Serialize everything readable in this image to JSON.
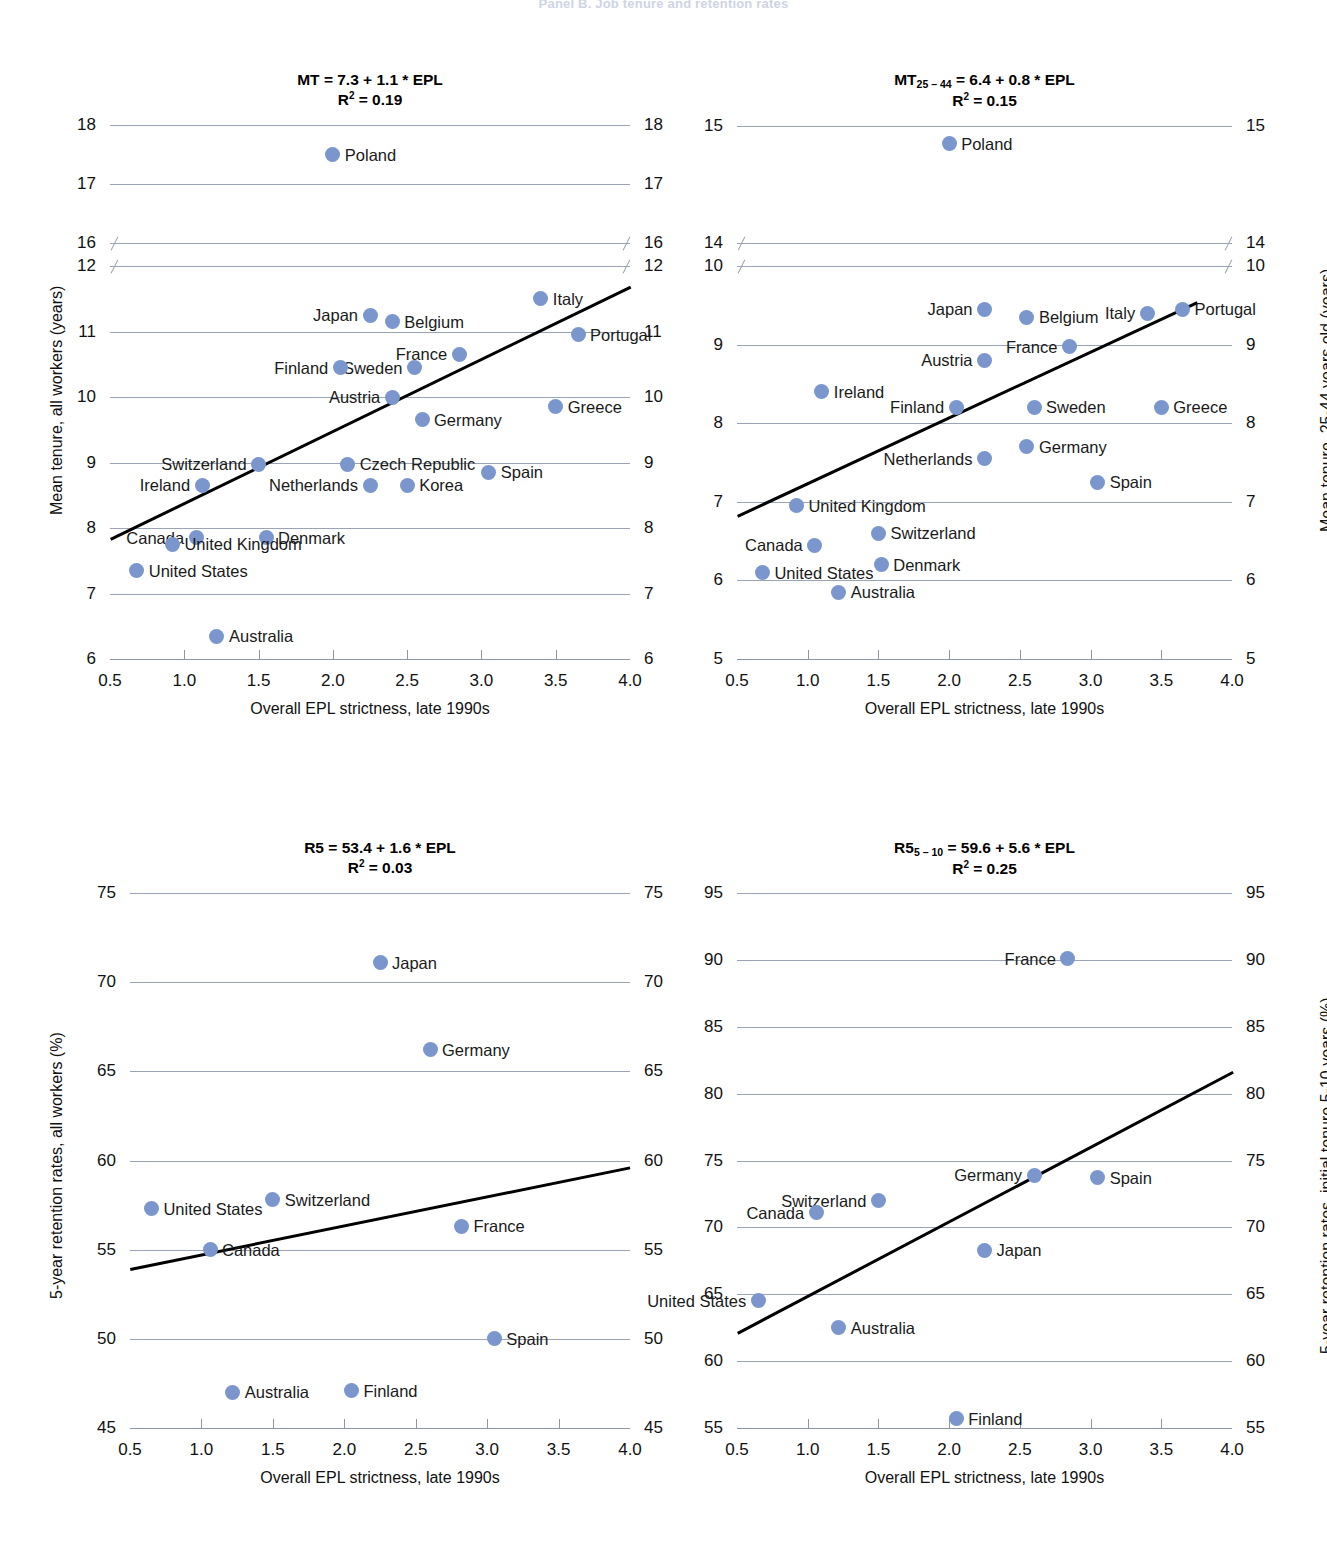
{
  "figure": {
    "header": "Panel B. Job tenure and retention rates",
    "xaxis_title": "Overall EPL strictness, late 1990s"
  },
  "chart_data": [
    {
      "type": "scatter",
      "panel": "top-left",
      "title_main": "MT = 7.3 + 1.1 * EPL",
      "title_r2_label": "R",
      "title_r2_sup": "2",
      "title_r2_value": " = 0.19",
      "xlabel": "Overall EPL strictness, late 1990s",
      "ylabel": "Mean tenure, all workers (years)",
      "xlim": [
        0.5,
        4.0
      ],
      "xticks": [
        0.5,
        1.0,
        1.5,
        2.0,
        2.5,
        3.0,
        3.5,
        4.0
      ],
      "yticks_upper": [
        18,
        17,
        16
      ],
      "yticks_lower": [
        12,
        11,
        10,
        9,
        8,
        7,
        6
      ],
      "axis_break_between": [
        16,
        12
      ],
      "grid": true,
      "trendline": {
        "x0": 0.5,
        "y0": 7.85,
        "x1": 4.0,
        "y1": 11.7
      },
      "points": [
        {
          "label": "Poland",
          "x": 2.0,
          "y": 17.5,
          "side": "r"
        },
        {
          "label": "Italy",
          "x": 3.4,
          "y": 11.5,
          "side": "r"
        },
        {
          "label": "Japan",
          "x": 2.25,
          "y": 11.25,
          "side": "l"
        },
        {
          "label": "Belgium",
          "x": 2.4,
          "y": 11.15,
          "side": "r"
        },
        {
          "label": "Portugal",
          "x": 3.65,
          "y": 10.95,
          "side": "r"
        },
        {
          "label": "France",
          "x": 2.85,
          "y": 10.65,
          "side": "l"
        },
        {
          "label": "Sweden",
          "x": 2.55,
          "y": 10.45,
          "side": "l"
        },
        {
          "label": "Finland",
          "x": 2.05,
          "y": 10.45,
          "side": "l"
        },
        {
          "label": "Austria",
          "x": 2.4,
          "y": 10.0,
          "side": "l"
        },
        {
          "label": "Greece",
          "x": 3.5,
          "y": 9.85,
          "side": "r"
        },
        {
          "label": "Germany",
          "x": 2.6,
          "y": 9.65,
          "side": "r"
        },
        {
          "label": "Switzerland",
          "x": 1.5,
          "y": 8.97,
          "side": "l"
        },
        {
          "label": "Czech Republic",
          "x": 2.1,
          "y": 8.97,
          "side": "r"
        },
        {
          "label": "Spain",
          "x": 3.05,
          "y": 8.85,
          "side": "r"
        },
        {
          "label": "Ireland",
          "x": 1.12,
          "y": 8.65,
          "side": "l"
        },
        {
          "label": "Netherlands",
          "x": 2.25,
          "y": 8.65,
          "side": "l"
        },
        {
          "label": "Korea",
          "x": 2.5,
          "y": 8.65,
          "side": "r"
        },
        {
          "label": "Canada",
          "x": 1.08,
          "y": 7.85,
          "side": "l"
        },
        {
          "label": "Denmark",
          "x": 1.55,
          "y": 7.85,
          "side": "r"
        },
        {
          "label": "United Kingdom",
          "x": 0.92,
          "y": 7.75,
          "side": "r"
        },
        {
          "label": "United States",
          "x": 0.68,
          "y": 7.35,
          "side": "r"
        },
        {
          "label": "Australia",
          "x": 1.22,
          "y": 6.35,
          "side": "r"
        }
      ]
    },
    {
      "type": "scatter",
      "panel": "top-right",
      "title_main_pre": "MT",
      "title_main_sub": "25 – 44",
      "title_main_post": " = 6.4 + 0.8 * EPL",
      "title_r2_label": "R",
      "title_r2_sup": "2",
      "title_r2_value": " = 0.15",
      "xlabel": "Overall EPL strictness, late 1990s",
      "ylabel": "Mean tenure, 25-44 years old (years)",
      "xlim": [
        0.5,
        4.0
      ],
      "xticks": [
        0.5,
        1.0,
        1.5,
        2.0,
        2.5,
        3.0,
        3.5,
        4.0
      ],
      "yticks_upper": [
        15,
        14
      ],
      "yticks_lower": [
        10,
        9,
        8,
        7,
        6,
        5
      ],
      "axis_break_between": [
        14,
        10
      ],
      "grid": true,
      "trendline": {
        "x0": 0.5,
        "y0": 6.83,
        "x1": 3.75,
        "y1": 9.55
      },
      "points": [
        {
          "label": "Poland",
          "x": 2.0,
          "y": 14.85,
          "side": "r"
        },
        {
          "label": "Italy",
          "x": 3.4,
          "y": 9.4,
          "side": "l"
        },
        {
          "label": "Portugal",
          "x": 3.65,
          "y": 9.45,
          "side": "r"
        },
        {
          "label": "Japan",
          "x": 2.25,
          "y": 9.45,
          "side": "l"
        },
        {
          "label": "Belgium",
          "x": 2.55,
          "y": 9.35,
          "side": "r"
        },
        {
          "label": "France",
          "x": 2.85,
          "y": 8.97,
          "side": "l"
        },
        {
          "label": "Austria",
          "x": 2.25,
          "y": 8.8,
          "side": "l"
        },
        {
          "label": "Ireland",
          "x": 1.1,
          "y": 8.4,
          "side": "r"
        },
        {
          "label": "Finland",
          "x": 2.05,
          "y": 8.2,
          "side": "l"
        },
        {
          "label": "Sweden",
          "x": 2.6,
          "y": 8.2,
          "side": "r"
        },
        {
          "label": "Greece",
          "x": 3.5,
          "y": 8.2,
          "side": "r"
        },
        {
          "label": "Germany",
          "x": 2.55,
          "y": 7.7,
          "side": "r"
        },
        {
          "label": "Netherlands",
          "x": 2.25,
          "y": 7.55,
          "side": "l"
        },
        {
          "label": "Spain",
          "x": 3.05,
          "y": 7.25,
          "side": "r"
        },
        {
          "label": "United Kingdom",
          "x": 0.92,
          "y": 6.95,
          "side": "r"
        },
        {
          "label": "Switzerland",
          "x": 1.5,
          "y": 6.6,
          "side": "r"
        },
        {
          "label": "Canada",
          "x": 1.05,
          "y": 6.45,
          "side": "l"
        },
        {
          "label": "Denmark",
          "x": 1.52,
          "y": 6.2,
          "side": "r"
        },
        {
          "label": "United States",
          "x": 0.68,
          "y": 6.1,
          "side": "r"
        },
        {
          "label": "Australia",
          "x": 1.22,
          "y": 5.85,
          "side": "r"
        }
      ]
    },
    {
      "type": "scatter",
      "panel": "bottom-left",
      "title_main": "R5 = 53.4 + 1.6 * EPL",
      "title_r2_label": "R",
      "title_r2_sup": "2",
      "title_r2_value": " = 0.03",
      "xlabel": "Overall EPL strictness, late 1990s",
      "ylabel": "5-year retention rates, all workers (%)",
      "xlim": [
        0.5,
        4.0
      ],
      "xticks": [
        0.5,
        1.0,
        1.5,
        2.0,
        2.5,
        3.0,
        3.5,
        4.0
      ],
      "yticks": [
        75,
        70,
        65,
        60,
        55,
        50,
        45
      ],
      "grid": true,
      "trendline": {
        "x0": 0.5,
        "y0": 54.0,
        "x1": 4.0,
        "y1": 59.7
      },
      "points": [
        {
          "label": "Japan",
          "x": 2.25,
          "y": 71.1,
          "side": "r"
        },
        {
          "label": "Germany",
          "x": 2.6,
          "y": 66.2,
          "side": "r"
        },
        {
          "label": "United States",
          "x": 0.65,
          "y": 57.3,
          "side": "r"
        },
        {
          "label": "Switzerland",
          "x": 1.5,
          "y": 57.8,
          "side": "r"
        },
        {
          "label": "France",
          "x": 2.82,
          "y": 56.3,
          "side": "r"
        },
        {
          "label": "Canada",
          "x": 1.06,
          "y": 55.0,
          "side": "r"
        },
        {
          "label": "Spain",
          "x": 3.05,
          "y": 50.0,
          "side": "r"
        },
        {
          "label": "Australia",
          "x": 1.22,
          "y": 47.0,
          "side": "r"
        },
        {
          "label": "Finland",
          "x": 2.05,
          "y": 47.1,
          "side": "r"
        }
      ]
    },
    {
      "type": "scatter",
      "panel": "bottom-right",
      "title_main_pre": "R5",
      "title_main_sub": "5 – 10",
      "title_main_post": " = 59.6 + 5.6 * EPL",
      "title_r2_label": "R",
      "title_r2_sup": "2",
      "title_r2_value": " = 0.25",
      "xlabel": "Overall EPL strictness, late 1990s",
      "ylabel": "5-year retention rates, initial tenure 5-10 years (%)",
      "xlim": [
        0.5,
        4.0
      ],
      "xticks": [
        0.5,
        1.0,
        1.5,
        2.0,
        2.5,
        3.0,
        3.5,
        4.0
      ],
      "yticks": [
        95,
        90,
        85,
        80,
        75,
        70,
        65,
        60,
        55
      ],
      "grid": true,
      "trendline": {
        "x0": 0.5,
        "y0": 62.2,
        "x1": 4.0,
        "y1": 81.7
      },
      "points": [
        {
          "label": "France",
          "x": 2.84,
          "y": 90.1,
          "side": "l"
        },
        {
          "label": "Germany",
          "x": 2.6,
          "y": 73.9,
          "side": "l"
        },
        {
          "label": "Spain",
          "x": 3.05,
          "y": 73.7,
          "side": "r"
        },
        {
          "label": "Switzerland",
          "x": 1.5,
          "y": 72.0,
          "side": "l"
        },
        {
          "label": "Canada",
          "x": 1.06,
          "y": 71.1,
          "side": "l"
        },
        {
          "label": "Japan",
          "x": 2.25,
          "y": 68.3,
          "side": "r"
        },
        {
          "label": "United States",
          "x": 0.65,
          "y": 64.5,
          "side": "l"
        },
        {
          "label": "Australia",
          "x": 1.22,
          "y": 62.5,
          "side": "r"
        },
        {
          "label": "Finland",
          "x": 2.05,
          "y": 55.7,
          "side": "r"
        }
      ]
    }
  ]
}
